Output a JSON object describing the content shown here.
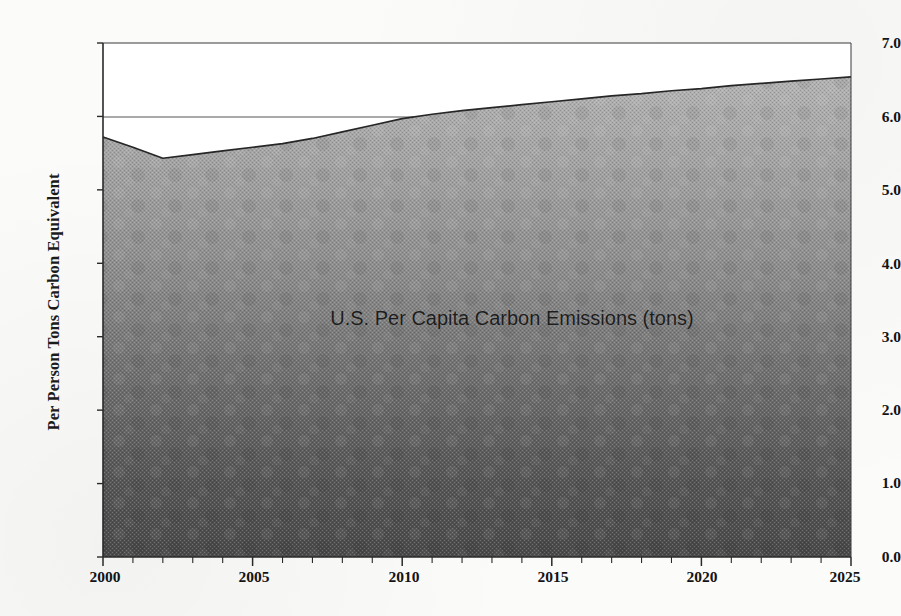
{
  "figure": {
    "background_color": "#fbfbfa",
    "axis_color": "#2a2a2a",
    "fill_top_color": "#a9a9a9",
    "fill_bottom_color": "#4a4a4a"
  },
  "axes": {
    "ylabel": "Per Person Tons Carbon Equivalent",
    "yticks": [
      "0.0",
      "1.0",
      "2.0",
      "3.0",
      "4.0",
      "5.0",
      "6.0",
      "7.0"
    ],
    "xticks": [
      "2000",
      "2005",
      "2010",
      "2015",
      "2020",
      "2025"
    ]
  },
  "chart_data": {
    "type": "area",
    "title": "U.S. Per Capita Carbon Emissions (tons)",
    "xlabel": "",
    "ylabel": "Per Person Tons Carbon Equivalent",
    "xlim": [
      2000,
      2025
    ],
    "ylim": [
      0.0,
      7.0
    ],
    "grid": "horizontal gridlines at 6.0 and 7.0 only (visible above the shaded area)",
    "legend": "none",
    "annotations": [
      "U.S. Per Capita Carbon Emissions (tons)"
    ],
    "x": [
      2000,
      2001,
      2002,
      2003,
      2004,
      2005,
      2006,
      2007,
      2008,
      2009,
      2010,
      2011,
      2012,
      2013,
      2014,
      2015,
      2016,
      2017,
      2018,
      2019,
      2020,
      2021,
      2022,
      2023,
      2024,
      2025
    ],
    "values": [
      5.72,
      5.58,
      5.43,
      5.48,
      5.53,
      5.58,
      5.63,
      5.7,
      5.79,
      5.88,
      5.97,
      6.03,
      6.08,
      6.12,
      6.16,
      6.2,
      6.24,
      6.28,
      6.31,
      6.35,
      6.38,
      6.42,
      6.45,
      6.48,
      6.51,
      6.54
    ],
    "series": [
      {
        "name": "U.S. Per Capita Carbon Emissions (tons)",
        "values": [
          5.72,
          5.58,
          5.43,
          5.48,
          5.53,
          5.58,
          5.63,
          5.7,
          5.79,
          5.88,
          5.97,
          6.03,
          6.08,
          6.12,
          6.16,
          6.2,
          6.24,
          6.28,
          6.31,
          6.35,
          6.38,
          6.42,
          6.45,
          6.48,
          6.51,
          6.54
        ]
      }
    ],
    "notes": [
      "Values decline from 5.72 in 2000 to a minimum of 5.43 in 2002",
      "Values then rise steadily to 6.54 in 2025",
      "Curve crosses the 6.0 gridline near 2010"
    ]
  }
}
